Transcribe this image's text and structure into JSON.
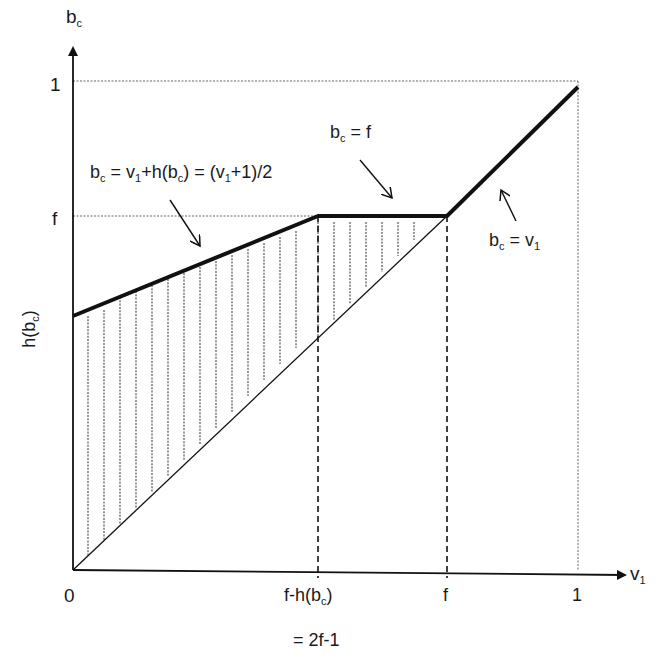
{
  "diagram": {
    "axes": {
      "y_label": "b",
      "y_label_sub": "c",
      "x_label": "v",
      "x_label_sub": "1",
      "y_side_label": "h(b",
      "y_side_label_sub": "c",
      "y_side_label_close": ")"
    },
    "y_ticks": {
      "one": "1",
      "f": "f"
    },
    "x_ticks": {
      "zero": "0",
      "fh_main": "f-h(b",
      "fh_sub": "c",
      "fh_close": ")",
      "fh_eq": "= 2f-1",
      "f": "f",
      "one": "1"
    },
    "annotations": {
      "rising": {
        "a": "b",
        "a_sub": "c",
        "b": " = v",
        "b_sub": "1",
        "c": "+h(b",
        "c_sub": "c",
        "d": ") = (v",
        "d_sub": "1",
        "e": "+1)/2"
      },
      "flat": {
        "a": "b",
        "a_sub": "c",
        "b": " = f"
      },
      "diag": {
        "a": "b",
        "a_sub": "c",
        "b": " = v",
        "b_sub": "1"
      }
    },
    "colors": {
      "ink": "#111111",
      "guide": "#555555"
    }
  }
}
